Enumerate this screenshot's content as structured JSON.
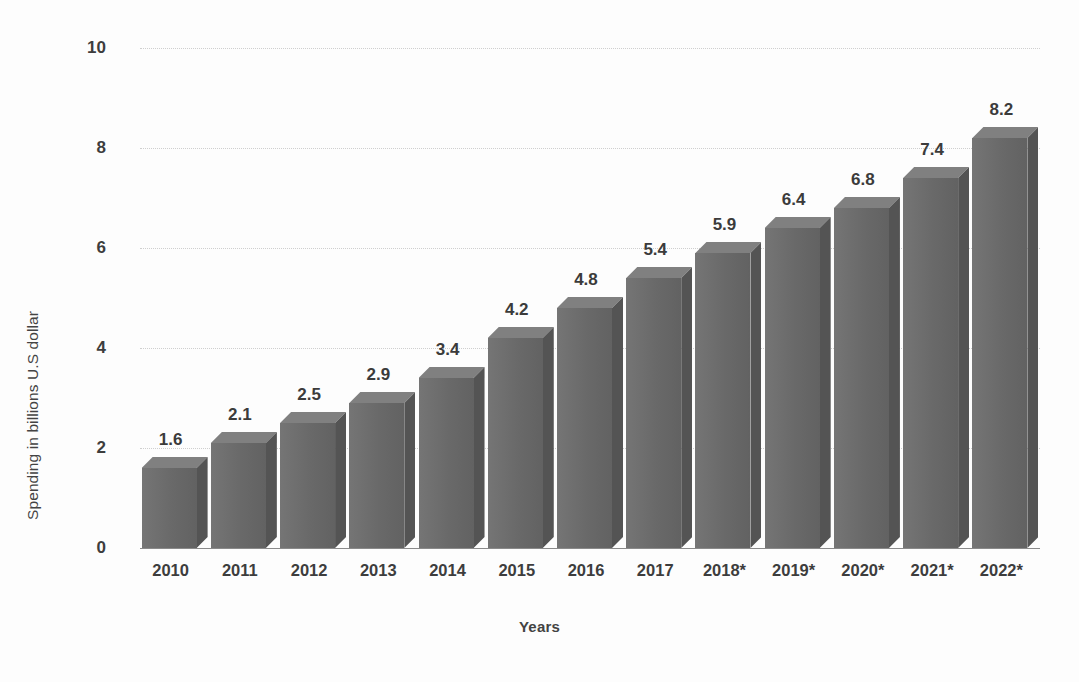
{
  "chart_data": {
    "type": "bar",
    "title": "",
    "subtitle": "",
    "xlabel": "Years",
    "ylabel": "Spending in billions U.S dollar",
    "categories": [
      "2010",
      "2011",
      "2012",
      "2013",
      "2014",
      "2015",
      "2016",
      "2017",
      "2018*",
      "2019*",
      "2020*",
      "2021*",
      "2022*"
    ],
    "values": [
      1.6,
      2.1,
      2.5,
      2.9,
      3.4,
      4.2,
      4.8,
      5.4,
      5.9,
      6.4,
      6.8,
      7.4,
      8.2
    ],
    "data_labels": [
      "1.6",
      "2.1",
      "2.5",
      "2.9",
      "3.4",
      "4.2",
      "4.8",
      "5.4",
      "5.9",
      "6.4",
      "6.8",
      "7.4",
      "8.2"
    ],
    "ylim": [
      0,
      10
    ],
    "y_ticks": [
      0,
      2,
      4,
      6,
      8,
      10
    ],
    "y_tick_labels": [
      "0",
      "2",
      "4",
      "6",
      "8",
      "10"
    ],
    "grid": true,
    "grid_axis": "y",
    "legend": false,
    "legend_position": "none",
    "style": "3d-column",
    "colors": {
      "bar_front": "#6e6e6e",
      "bar_side": "#545454",
      "bar_top": "#808080",
      "gridline": "#cfcfcf",
      "axis_line": "#8a8a8a",
      "text": "#3d3d3d",
      "background": "#fdfdfd"
    }
  }
}
